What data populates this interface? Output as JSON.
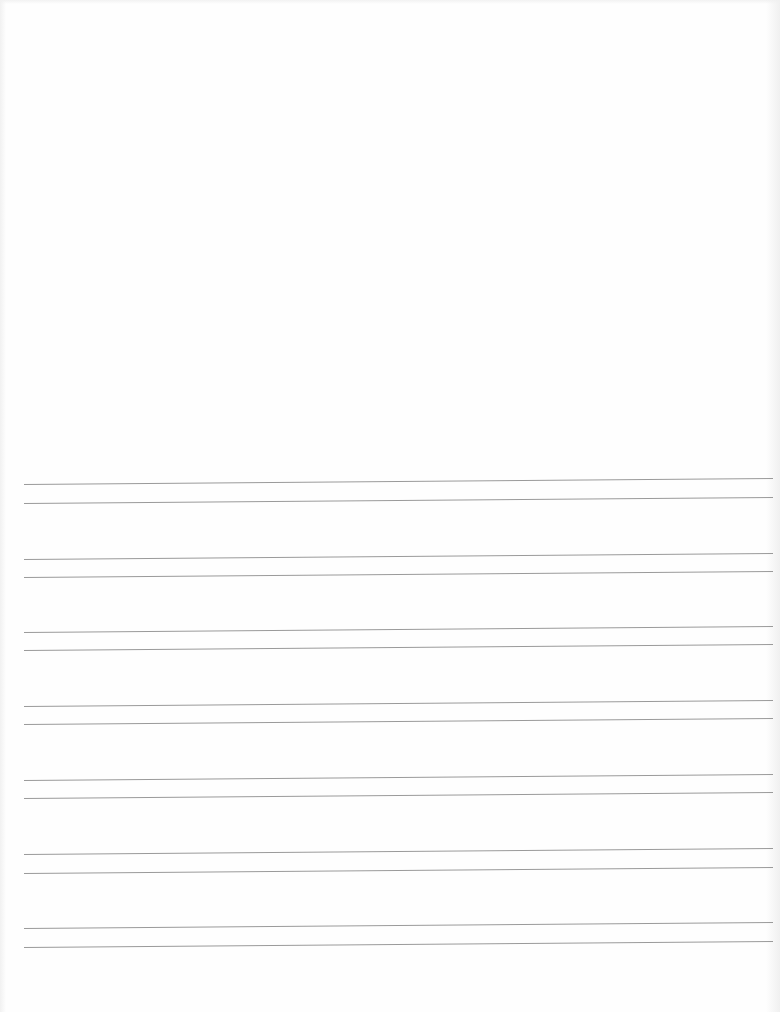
{
  "document": {
    "type": "ruled-writing-sheet",
    "background_color": "#fefefe",
    "line_color": "#9a9a9a",
    "line_start_x": 24,
    "line_end_x": 773,
    "tilt_px": -6,
    "line_pairs": [
      {
        "top_y": 484,
        "bottom_y": 503
      },
      {
        "top_y": 559,
        "bottom_y": 577
      },
      {
        "top_y": 632,
        "bottom_y": 650
      },
      {
        "top_y": 706,
        "bottom_y": 724
      },
      {
        "top_y": 780,
        "bottom_y": 798
      },
      {
        "top_y": 854,
        "bottom_y": 873
      },
      {
        "top_y": 928,
        "bottom_y": 947
      }
    ]
  }
}
